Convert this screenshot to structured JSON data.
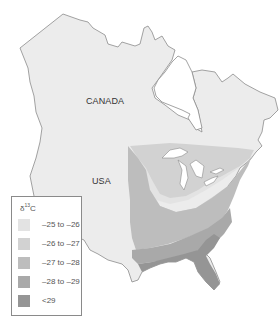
{
  "map": {
    "labels": {
      "canada": "CANADA",
      "usa": "USA"
    },
    "colors": {
      "land": "#ececec",
      "outline": "#8c8c8c",
      "water": "#ffffff"
    }
  },
  "legend": {
    "title_prefix": "δ",
    "title_sup": "13",
    "title_suffix": "C",
    "items": [
      {
        "label": "–25 to –26",
        "color": "#e3e3e3"
      },
      {
        "label": "–26 to –27",
        "color": "#d2d2d2"
      },
      {
        "label": "–27 to –28",
        "color": "#bdbdbd"
      },
      {
        "label": "–28 to –29",
        "color": "#a9a9a9"
      },
      {
        "label": "<29",
        "color": "#959595"
      }
    ]
  }
}
